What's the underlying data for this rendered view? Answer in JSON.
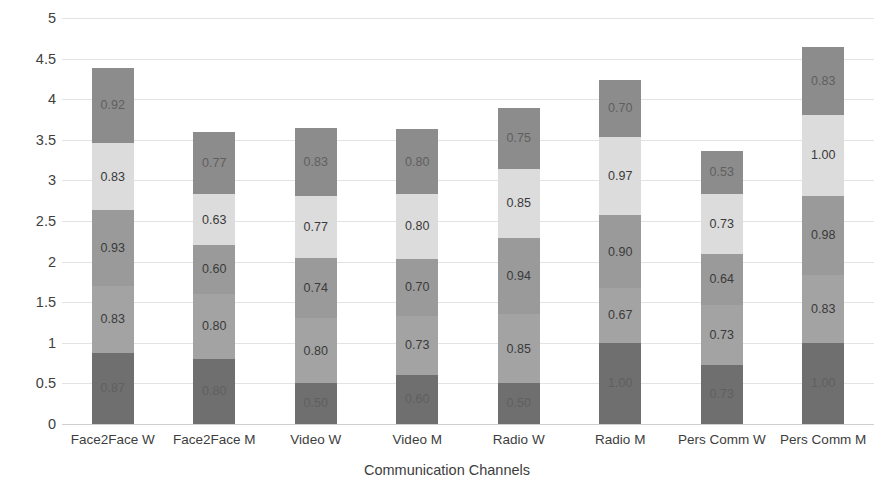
{
  "chart_data": {
    "type": "bar",
    "subtype": "stacked-bar",
    "title": "",
    "xlabel": "Communication Channels",
    "ylabel": "Cumulative Score (weighted)",
    "ylim": [
      0,
      5
    ],
    "ytick_step": 0.5,
    "yticks": [
      "0",
      "0.5",
      "1",
      "1.5",
      "2",
      "2.5",
      "3",
      "3.5",
      "4",
      "4.5",
      "5"
    ],
    "grid": true,
    "legend": "none",
    "stack_order": "bottom-to-top",
    "categories": [
      "Face2Face W",
      "Face2Face M",
      "Video W",
      "Video M",
      "Radio W",
      "Radio M",
      "Pers Comm W",
      "Pers Comm M"
    ],
    "series": [
      {
        "name": "Segment 1",
        "color": "#6f6f6f",
        "values": [
          0.87,
          0.8,
          0.5,
          0.6,
          0.5,
          1.0,
          0.73,
          1.0
        ]
      },
      {
        "name": "Segment 2",
        "color": "#a3a3a3",
        "values": [
          0.83,
          0.8,
          0.8,
          0.73,
          0.85,
          0.67,
          0.73,
          0.83
        ]
      },
      {
        "name": "Segment 3",
        "color": "#9a9a9a",
        "values": [
          0.93,
          0.6,
          0.74,
          0.7,
          0.94,
          0.9,
          0.64,
          0.98
        ]
      },
      {
        "name": "Segment 4",
        "color": "#dcdcdc",
        "values": [
          0.83,
          0.63,
          0.77,
          0.8,
          0.85,
          0.97,
          0.73,
          1.0
        ]
      },
      {
        "name": "Segment 5",
        "color": "#8c8c8c",
        "values": [
          0.92,
          0.77,
          0.83,
          0.8,
          0.75,
          0.7,
          0.53,
          0.83
        ]
      }
    ],
    "totals": [
      4.38,
      3.6,
      3.64,
      3.63,
      3.89,
      4.24,
      3.36,
      4.64
    ],
    "colors": {
      "gridline": "#e3e3e3",
      "axis": "#cfcfcf",
      "text": "#3d3d3d",
      "background": "#ffffff"
    }
  }
}
